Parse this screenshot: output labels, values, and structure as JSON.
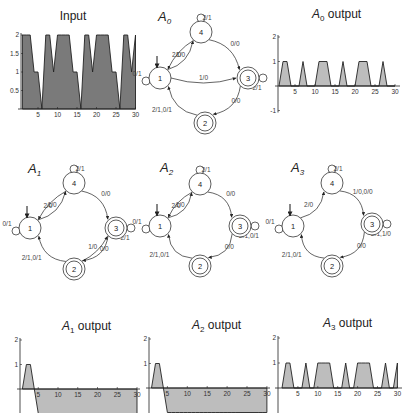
{
  "figure": {
    "panels": [
      {
        "id": "input",
        "title": "Input"
      },
      {
        "id": "a0-graph",
        "label": "A",
        "sub": "0"
      },
      {
        "id": "a0-output",
        "title_main": "A",
        "title_sub": "0",
        "title_rest": " output"
      },
      {
        "id": "a1-graph",
        "label": "A",
        "sub": "1"
      },
      {
        "id": "a2-graph",
        "label": "A",
        "sub": "2"
      },
      {
        "id": "a3-graph",
        "label": "A",
        "sub": "3"
      },
      {
        "id": "a1-output",
        "title_main": "A",
        "title_sub": "1",
        "title_rest": " output"
      },
      {
        "id": "a2-output",
        "title_main": "A",
        "title_sub": "2",
        "title_rest": " output"
      },
      {
        "id": "a3-output",
        "title_main": "A",
        "title_sub": "3",
        "title_rest": " output"
      }
    ],
    "colors": {
      "input_fill": "#7a7a7a",
      "output_fill": "#bdbdbd",
      "line": "#222222",
      "node_stroke": "#333333"
    }
  },
  "chart_data": [
    {
      "id": "input",
      "type": "area",
      "title": "Input",
      "x": [
        1,
        2,
        3,
        4,
        5,
        6,
        7,
        8,
        9,
        10,
        11,
        12,
        13,
        14,
        15,
        16,
        17,
        18,
        19,
        20,
        21,
        22,
        23,
        24,
        25,
        26,
        27,
        28,
        29,
        30
      ],
      "values": [
        2,
        2,
        2,
        1,
        1,
        0,
        2,
        2,
        1,
        2,
        2,
        2,
        2,
        1,
        1,
        0,
        2,
        2,
        1,
        2,
        2,
        2,
        2,
        1,
        1,
        0,
        2,
        2,
        1,
        2
      ],
      "xticks": [
        5,
        10,
        15,
        20,
        25,
        30
      ],
      "yticks": [
        "0.5",
        "1",
        "1.5",
        "2"
      ],
      "xlim": [
        0,
        30
      ],
      "ylim": [
        0,
        2
      ],
      "xlabel": "",
      "ylabel": ""
    },
    {
      "id": "a0-output",
      "type": "area",
      "title": "A0 output",
      "x": [
        1,
        2,
        3,
        4,
        5,
        6,
        7,
        8,
        9,
        10,
        11,
        12,
        13,
        14,
        15,
        16,
        17,
        18,
        19,
        20,
        21,
        22,
        23,
        24,
        25,
        26,
        27,
        28,
        29,
        30
      ],
      "values": [
        0,
        1,
        1,
        0,
        0,
        0,
        1,
        0,
        0,
        0,
        1,
        1,
        1,
        0,
        0,
        0,
        1,
        0,
        0,
        0,
        1,
        1,
        1,
        0,
        0,
        0,
        1,
        0,
        0,
        0
      ],
      "xticks": [
        5,
        10,
        15,
        20,
        25,
        30
      ],
      "yticks": [
        "-1",
        "1",
        "2"
      ],
      "xlim": [
        0,
        30
      ],
      "ylim": [
        -1,
        2
      ]
    },
    {
      "id": "a1-output",
      "type": "area",
      "title": "A1 output",
      "x": [
        1,
        2,
        3,
        4,
        5,
        6,
        7,
        8,
        9,
        10,
        11,
        12,
        13,
        14,
        15,
        16,
        17,
        18,
        19,
        20,
        21,
        22,
        23,
        24,
        25,
        26,
        27,
        28,
        29,
        30
      ],
      "values": [
        0,
        1,
        1,
        0,
        -1,
        -1,
        -1,
        -1,
        -1,
        -1,
        -1,
        -1,
        -1,
        -1,
        -1,
        -1,
        -1,
        -1,
        -1,
        -1,
        -1,
        -1,
        -1,
        -1,
        -1,
        -1,
        -1,
        -1,
        -1,
        -1
      ],
      "xticks": [
        5,
        10,
        15,
        20,
        25,
        30
      ],
      "yticks": [
        "1",
        "2"
      ],
      "xlim": [
        0,
        30
      ],
      "ylim": [
        -1,
        2
      ]
    },
    {
      "id": "a2-output",
      "type": "area",
      "title": "A2 output",
      "x": [
        1,
        2,
        3,
        4,
        5,
        6,
        7,
        8,
        9,
        10,
        11,
        12,
        13,
        14,
        15,
        16,
        17,
        18,
        19,
        20,
        21,
        22,
        23,
        24,
        25,
        26,
        27,
        28,
        29,
        30
      ],
      "values": [
        0,
        1,
        1,
        0,
        -1,
        -1,
        -1,
        -1,
        -1,
        -1,
        -1,
        -1,
        -1,
        -1,
        -1,
        -1,
        -1,
        -1,
        -1,
        -1,
        -1,
        -1,
        -1,
        -1,
        -1,
        -1,
        -1,
        -1,
        -1,
        -1
      ],
      "xticks": [
        5,
        10,
        15,
        20,
        25,
        30
      ],
      "yticks": [
        "1",
        "2"
      ],
      "xlim": [
        0,
        30
      ],
      "ylim": [
        -1,
        2
      ]
    },
    {
      "id": "a3-output",
      "type": "area",
      "title": "A3 output",
      "x": [
        1,
        2,
        3,
        4,
        5,
        6,
        7,
        8,
        9,
        10,
        11,
        12,
        13,
        14,
        15,
        16,
        17,
        18,
        19,
        20,
        21,
        22,
        23,
        24,
        25,
        26,
        27,
        28,
        29,
        30
      ],
      "values": [
        0,
        1,
        1,
        0,
        0,
        0,
        1,
        0,
        0,
        1,
        1,
        1,
        1,
        0,
        0,
        0,
        1,
        0,
        0,
        1,
        1,
        1,
        1,
        0,
        0,
        0,
        1,
        0,
        0,
        1
      ],
      "xticks": [
        5,
        10,
        15,
        20,
        25,
        30
      ],
      "yticks": [
        "1",
        "2"
      ],
      "xlim": [
        0,
        30
      ],
      "ylim": [
        -1,
        2
      ]
    }
  ],
  "graphs": [
    {
      "id": "a0-graph",
      "nodes": [
        {
          "id": "4",
          "label": "4",
          "accepting": false
        },
        {
          "id": "1",
          "label": "1",
          "accepting": false,
          "initial": true
        },
        {
          "id": "3",
          "label": "3",
          "accepting": true
        },
        {
          "id": "2",
          "label": "2",
          "accepting": true
        }
      ],
      "edges": [
        {
          "from": "4",
          "to": "4",
          "label": "2/1"
        },
        {
          "from": "1",
          "to": "1",
          "label": "0/1"
        },
        {
          "from": "1",
          "to": "4",
          "label": "2/0"
        },
        {
          "from": "4",
          "to": "1",
          "label": "1/0"
        },
        {
          "from": "4",
          "to": "3",
          "label": "0/0"
        },
        {
          "from": "1",
          "to": "3",
          "label": "1/0"
        },
        {
          "from": "3",
          "to": "3",
          "label": "2/1"
        },
        {
          "from": "3",
          "to": "2",
          "label": "0/0"
        },
        {
          "from": "2",
          "to": "1",
          "label": "2/1,0/1"
        }
      ]
    },
    {
      "id": "a1-graph",
      "nodes": [
        {
          "id": "4",
          "label": "4",
          "accepting": false
        },
        {
          "id": "1",
          "label": "1",
          "accepting": false,
          "initial": true
        },
        {
          "id": "3",
          "label": "3",
          "accepting": true
        },
        {
          "id": "2",
          "label": "2",
          "accepting": true
        }
      ],
      "edges": [
        {
          "from": "4",
          "to": "4",
          "label": "2/1"
        },
        {
          "from": "1",
          "to": "1",
          "label": "0/1"
        },
        {
          "from": "1",
          "to": "4",
          "label": "2/0"
        },
        {
          "from": "4",
          "to": "1",
          "label": "1/0"
        },
        {
          "from": "4",
          "to": "3",
          "label": "0/0"
        },
        {
          "from": "3",
          "to": "3",
          "label": "2/1"
        },
        {
          "from": "2",
          "to": "3",
          "label": "1/0"
        },
        {
          "from": "3",
          "to": "2",
          "label": "0/0"
        },
        {
          "from": "2",
          "to": "1",
          "label": "2/1,0/1"
        }
      ]
    },
    {
      "id": "a2-graph",
      "nodes": [
        {
          "id": "4",
          "label": "4",
          "accepting": false
        },
        {
          "id": "1",
          "label": "1",
          "accepting": false,
          "initial": true
        },
        {
          "id": "3",
          "label": "3",
          "accepting": true
        },
        {
          "id": "2",
          "label": "2",
          "accepting": true
        }
      ],
      "edges": [
        {
          "from": "4",
          "to": "4",
          "label": "2/1"
        },
        {
          "from": "1",
          "to": "1",
          "label": "0/1"
        },
        {
          "from": "1",
          "to": "4",
          "label": "2/0"
        },
        {
          "from": "4",
          "to": "1",
          "label": "1/0"
        },
        {
          "from": "4",
          "to": "3",
          "label": "0/0"
        },
        {
          "from": "3",
          "to": "3",
          "label": "2/1,0/1"
        },
        {
          "from": "3",
          "to": "2",
          "label": "0/0"
        },
        {
          "from": "2",
          "to": "1",
          "label": "2/1,0/1"
        }
      ]
    },
    {
      "id": "a3-graph",
      "nodes": [
        {
          "id": "4",
          "label": "4",
          "accepting": false
        },
        {
          "id": "1",
          "label": "1",
          "accepting": false,
          "initial": true
        },
        {
          "id": "3",
          "label": "3",
          "accepting": true
        },
        {
          "id": "2",
          "label": "2",
          "accepting": true
        }
      ],
      "edges": [
        {
          "from": "4",
          "to": "4",
          "label": "2/1"
        },
        {
          "from": "1",
          "to": "1",
          "label": "0/1"
        },
        {
          "from": "1",
          "to": "4",
          "label": "2/0"
        },
        {
          "from": "4",
          "to": "3",
          "label": "1/0,0/0"
        },
        {
          "from": "3",
          "to": "3",
          "label": "2/1,1/0"
        },
        {
          "from": "3",
          "to": "2",
          "label": "0/0"
        },
        {
          "from": "2",
          "to": "1",
          "label": "2/1,0/1"
        }
      ]
    }
  ]
}
